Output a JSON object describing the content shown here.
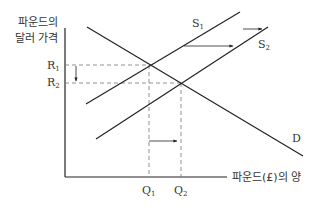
{
  "diagram": {
    "y_axis_label_line1": "파운드의",
    "y_axis_label_line2": "달러 가격",
    "x_axis_label": "파운드(£)의 양",
    "price_labels": [
      {
        "main": "R",
        "sub": "1"
      },
      {
        "main": "R",
        "sub": "2"
      }
    ],
    "quantity_labels": [
      {
        "main": "Q",
        "sub": "1"
      },
      {
        "main": "Q",
        "sub": "2"
      }
    ],
    "curves": {
      "supply1": {
        "main": "S",
        "sub": "1"
      },
      "supply2": {
        "main": "S",
        "sub": "2"
      },
      "demand": "D"
    },
    "colors": {
      "line": "#222222",
      "dash": "#777777",
      "text": "#333333"
    }
  }
}
